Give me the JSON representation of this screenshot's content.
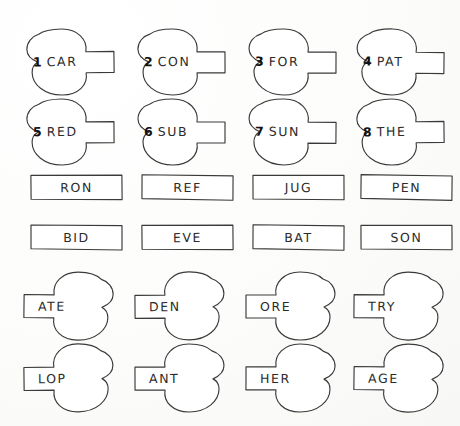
{
  "worksheet": {
    "title": "Word Building Puzzle Pieces",
    "background_color": "#fdfdfc",
    "line_color": "#3a3a3a",
    "text_color": "#2b2b2b",
    "number_color": "#111111"
  },
  "sections": {
    "prefixes": {
      "name": "numbered-prefix-pieces",
      "shape": "bulb-left-tail-right",
      "items": [
        {
          "number": "1",
          "word": "CAR"
        },
        {
          "number": "2",
          "word": "CON"
        },
        {
          "number": "3",
          "word": "FOR"
        },
        {
          "number": "4",
          "word": "PAT"
        },
        {
          "number": "5",
          "word": "RED"
        },
        {
          "number": "6",
          "word": "SUB"
        },
        {
          "number": "7",
          "word": "SUN"
        },
        {
          "number": "8",
          "word": "THE"
        }
      ]
    },
    "middles": {
      "name": "rectangle-middle-pieces",
      "shape": "rectangle",
      "items": [
        {
          "word": "RON"
        },
        {
          "word": "REF"
        },
        {
          "word": "JUG"
        },
        {
          "word": "PEN"
        },
        {
          "word": "BID"
        },
        {
          "word": "EVE"
        },
        {
          "word": "BAT"
        },
        {
          "word": "SON"
        }
      ]
    },
    "suffixes": {
      "name": "suffix-pieces",
      "shape": "tail-left-bulb-right",
      "items": [
        {
          "word": "ATE"
        },
        {
          "word": "DEN"
        },
        {
          "word": "ORE"
        },
        {
          "word": "TRY"
        },
        {
          "word": "LOP"
        },
        {
          "word": "ANT"
        },
        {
          "word": "HER"
        },
        {
          "word": "AGE"
        }
      ]
    }
  }
}
